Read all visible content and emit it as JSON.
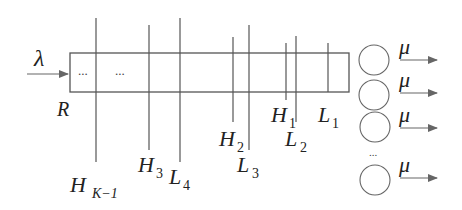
{
  "diagram": {
    "type": "queueing-system-with-thresholds",
    "input": {
      "label": "λ"
    },
    "buffer": {
      "label": "R",
      "ellipses": [
        "...",
        "..."
      ]
    },
    "thresholds": [
      {
        "id": "H_K-1",
        "label_main": "H",
        "label_sub": "K−1"
      },
      {
        "id": "H_3",
        "label_main": "H",
        "label_sub": "3"
      },
      {
        "id": "L_4",
        "label_main": "L",
        "label_sub": "4"
      },
      {
        "id": "H_2",
        "label_main": "H",
        "label_sub": "2"
      },
      {
        "id": "L_3",
        "label_main": "L",
        "label_sub": "3"
      },
      {
        "id": "H_1",
        "label_main": "H",
        "label_sub": "1"
      },
      {
        "id": "L_2",
        "label_main": "L",
        "label_sub": "2"
      },
      {
        "id": "L_1",
        "label_main": "L",
        "label_sub": "1"
      }
    ],
    "servers": [
      {
        "output_label": "μ"
      },
      {
        "output_label": "μ"
      },
      {
        "output_label": "μ"
      },
      {
        "output_label": "μ"
      }
    ],
    "servers_ellipsis": "...",
    "colors": {
      "stroke": "#555555",
      "text": "#222222",
      "background": "#ffffff"
    }
  }
}
